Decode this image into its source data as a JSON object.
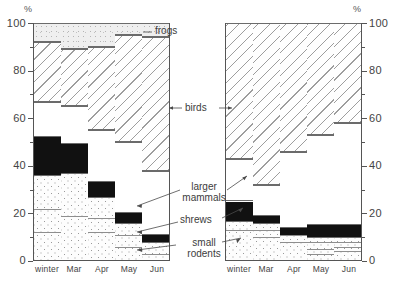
{
  "figure": {
    "axis_unit_label": "%",
    "categories": [
      "winter",
      "Mar",
      "Apr",
      "May",
      "Jun"
    ],
    "y_ticks": [
      0,
      20,
      40,
      60,
      80,
      100
    ],
    "annotations": {
      "frogs": "frogs",
      "birds": "birds",
      "larger_mammals_line1": "larger",
      "larger_mammals_line2": "mammals",
      "shrews": "shrews",
      "small_rodents_line1": "small",
      "small_rodents_line2": "rodents"
    }
  },
  "chart_data": [
    {
      "type": "bar",
      "id": "left-panel",
      "stacked": true,
      "stack_order_bottom_to_top": [
        "small rodents",
        "shrews",
        "larger mammals",
        "birds",
        "frogs"
      ],
      "title": "",
      "xlabel": "",
      "ylabel": "%",
      "ylim": [
        0,
        100
      ],
      "grid": false,
      "legend": "inline-annotations",
      "categories": [
        "winter",
        "Mar",
        "Apr",
        "May",
        "Jun"
      ],
      "series": [
        {
          "name": "small rodents",
          "values": [
            36,
            37,
            27,
            16,
            8
          ]
        },
        {
          "name": "shrews",
          "values": [
            16,
            12,
            6,
            4,
            3
          ]
        },
        {
          "name": "larger mammals",
          "values": [
            15,
            16,
            22,
            30,
            27
          ]
        },
        {
          "name": "birds",
          "values": [
            25,
            24,
            35,
            45,
            56
          ]
        },
        {
          "name": "frogs",
          "values": [
            8,
            11,
            10,
            5,
            6
          ]
        }
      ],
      "cumulative_tops": [
        {
          "category": "winter",
          "small_rodents": 36,
          "shrews": 52,
          "larger_mammals": 67,
          "birds": 92,
          "frogs": 100
        },
        {
          "category": "Mar",
          "small_rodents": 37,
          "shrews": 49,
          "larger_mammals": 65,
          "birds": 89,
          "frogs": 100
        },
        {
          "category": "Apr",
          "small_rodents": 27,
          "shrews": 33,
          "larger_mammals": 55,
          "birds": 90,
          "frogs": 100
        },
        {
          "category": "May",
          "small_rodents": 16,
          "shrews": 20,
          "larger_mammals": 50,
          "birds": 95,
          "frogs": 100
        },
        {
          "category": "Jun",
          "small_rodents": 8,
          "shrews": 11,
          "larger_mammals": 38,
          "birds": 94,
          "frogs": 100
        }
      ],
      "internal_divisions": {
        "winter": [
          12,
          22
        ],
        "Mar": [
          19
        ],
        "Apr": [
          12,
          18
        ],
        "May": [
          6,
          11
        ],
        "Jun": [
          3
        ]
      }
    },
    {
      "type": "bar",
      "id": "right-panel",
      "stacked": true,
      "stack_order_bottom_to_top": [
        "small rodents",
        "shrews",
        "larger mammals",
        "birds"
      ],
      "title": "",
      "xlabel": "",
      "ylabel": "%",
      "ylim": [
        0,
        100
      ],
      "grid": false,
      "legend": "inline-annotations",
      "categories": [
        "winter",
        "Mar",
        "Apr",
        "May",
        "Jun"
      ],
      "series": [
        {
          "name": "small rodents",
          "values": [
            17,
            16,
            11,
            10,
            10
          ]
        },
        {
          "name": "shrews",
          "values": [
            8,
            3,
            3,
            5,
            5
          ]
        },
        {
          "name": "larger mammals",
          "values": [
            18,
            13,
            32,
            38,
            43
          ]
        },
        {
          "name": "birds",
          "values": [
            57,
            68,
            54,
            47,
            42
          ]
        }
      ],
      "cumulative_tops": [
        {
          "category": "winter",
          "small_rodents": 17,
          "shrews": 25,
          "larger_mammals": 43,
          "birds": 100
        },
        {
          "category": "Mar",
          "small_rodents": 16,
          "shrews": 19,
          "larger_mammals": 32,
          "birds": 100
        },
        {
          "category": "Apr",
          "small_rodents": 11,
          "shrews": 14,
          "larger_mammals": 46,
          "birds": 100
        },
        {
          "category": "May",
          "small_rodents": 10,
          "shrews": 15,
          "larger_mammals": 53,
          "birds": 100
        },
        {
          "category": "Jun",
          "small_rodents": 10,
          "shrews": 15,
          "larger_mammals": 58,
          "birds": 100
        }
      ],
      "internal_divisions": {
        "winter": [
          13
        ],
        "Mar": [
          10,
          13
        ],
        "Apr": [
          8,
          11
        ],
        "May": [
          3,
          5,
          8
        ],
        "Jun": [
          4,
          6,
          8
        ]
      }
    }
  ]
}
